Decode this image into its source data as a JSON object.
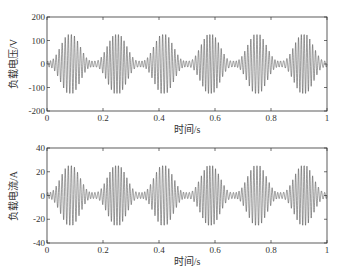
{
  "chart_data": [
    {
      "type": "line",
      "title": "",
      "xlabel": "时间/s",
      "ylabel": "负载电压/V",
      "xlim": [
        0,
        1
      ],
      "ylim": [
        -200,
        200
      ],
      "xticks": [
        "0",
        "0.2",
        "0.4",
        "0.6",
        "0.8",
        "1"
      ],
      "yticks": [
        "200",
        "100",
        "0",
        "-100",
        "-200"
      ],
      "grid": false,
      "legend": null,
      "series": [
        {
          "name": "负载电压",
          "description": "high-frequency oscillating voltage waveform with beat envelope",
          "amplitude": 125,
          "x": [
            0,
            1
          ],
          "envelope_upper": 125,
          "envelope_lower": -125,
          "beat_count": 6
        }
      ]
    },
    {
      "type": "line",
      "title": "",
      "xlabel": "时间/s",
      "ylabel": "负载电流/A",
      "xlim": [
        0,
        1
      ],
      "ylim": [
        -40,
        40
      ],
      "xticks": [
        "0",
        "0.2",
        "0.4",
        "0.6",
        "0.8",
        "1"
      ],
      "yticks": [
        "40",
        "20",
        "0",
        "-20",
        "-40"
      ],
      "grid": false,
      "legend": null,
      "series": [
        {
          "name": "负载电流",
          "description": "high-frequency oscillating current waveform with beat envelope",
          "amplitude": 25,
          "x": [
            0,
            1
          ],
          "envelope_upper": 25,
          "envelope_lower": -25,
          "beat_count": 6
        }
      ]
    }
  ],
  "plots": {
    "top": {
      "ylabel": "负载电压/V",
      "xlabel": "时间/s",
      "xticks": [
        "0",
        "0.2",
        "0.4",
        "0.6",
        "0.8",
        "1"
      ],
      "yticks": [
        "200",
        "100",
        "0",
        "-100",
        "-200"
      ]
    },
    "bottom": {
      "ylabel": "负载电流/A",
      "xlabel": "时间/s",
      "xticks": [
        "0",
        "0.2",
        "0.4",
        "0.6",
        "0.8",
        "1"
      ],
      "yticks": [
        "40",
        "20",
        "0",
        "-20",
        "-40"
      ]
    }
  }
}
